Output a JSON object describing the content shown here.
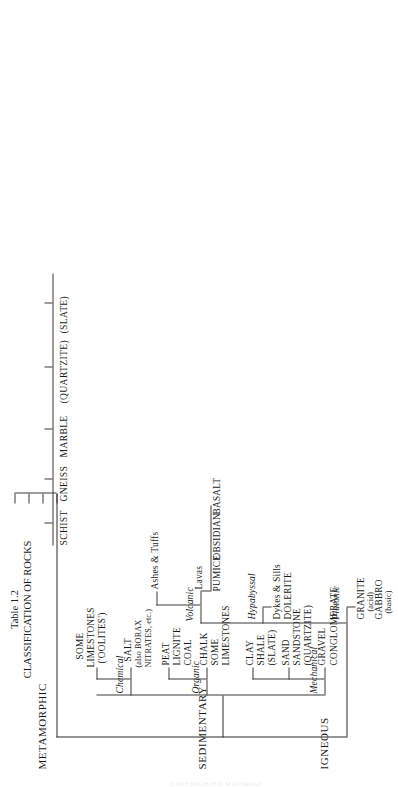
{
  "page": {
    "table_number": "Table 1.2",
    "title": "CLASSIFICATION OF ROCKS",
    "scan_header": "COPYRIGHTED MATERIAL"
  },
  "classes": [
    {
      "id": "igneous",
      "label": "IGNEOUS",
      "groups": [
        {
          "id": "plutonic",
          "label": "Plutonic",
          "entries": [
            {
              "name": "GRANITE",
              "note": "(acid)"
            },
            {
              "name": "GABBRO",
              "note": "(basic)"
            }
          ]
        },
        {
          "id": "hypabyssal",
          "label": "Hypabyssal",
          "entries": [
            {
              "name": "Dykes & Sills",
              "note": ""
            },
            {
              "name": "DOLERITE",
              "note": ""
            }
          ]
        },
        {
          "id": "volcanic",
          "label": "Volcanic",
          "subgroups": [
            {
              "id": "lavas",
              "label": "Lavas",
              "entries": [
                "PUMICE",
                "OBSIDIAN",
                "BASALT"
              ]
            },
            {
              "id": "ashes",
              "label": "Ashes & Tuffs",
              "entries": []
            }
          ]
        }
      ]
    },
    {
      "id": "sedimentary",
      "label": "SEDIMENTARY",
      "groups": [
        {
          "id": "mechanical",
          "label": "Mechanical",
          "rows": [
            {
              "source": "GRAVEL",
              "rock": "CONGLOMERATE",
              "meta": ""
            },
            {
              "source": "SAND",
              "rock": "SANDSTONE",
              "meta": "(QUARTZITE)"
            },
            {
              "source": "CLAY",
              "rock": "SHALE",
              "meta": "(SLATE)"
            }
          ]
        },
        {
          "id": "organic",
          "label": "Organic",
          "rows": [
            {
              "source": "CHALK",
              "rock": "SOME\nLIMESTONES",
              "meta": ""
            },
            {
              "source": "PEAT",
              "rock": "LIGNITE",
              "meta": "COAL"
            }
          ]
        },
        {
          "id": "chemical",
          "label": "Chemical",
          "rows": [
            {
              "source": "SALT",
              "rock": "(also BORAX\nNITRATES, etc.)",
              "meta": ""
            },
            {
              "source": "SOME\nLIMESTONES",
              "rock": "('OOLITES')",
              "meta": ""
            }
          ]
        }
      ]
    },
    {
      "id": "metamorphic",
      "label": "METAMORPHIC",
      "entries": [
        "SCHIST",
        "GNEISS",
        "MARBLE",
        "(QUARTZITE)",
        "(SLATE)"
      ]
    }
  ],
  "labels": {
    "igneous": "IGNEOUS",
    "sedimentary": "SEDIMENTARY",
    "metamorphic": "METAMORPHIC",
    "plutonic": "Plutonic",
    "hypabyssal": "Hypabyssal",
    "volcanic": "Volcanic",
    "mechanical": "Mechanical",
    "organic": "Organic",
    "chemical": "Chemical",
    "granite": "GRANITE",
    "granite_note": "(acid)",
    "gabbro": "GABBRO",
    "gabbro_note": "(basic)",
    "dykes_sills": "Dykes & Sills",
    "dolerite": "DOLERITE",
    "lavas": "Lavas",
    "ashes_tuffs": "Ashes & Tuffs",
    "pumice": "PUMICE",
    "obsidian": "OBSIDIAN",
    "basalt": "BASALT",
    "gravel": "GRAVEL",
    "conglomerate": "CONGLOMERATE",
    "sand": "SAND",
    "sandstone": "SANDSTONE",
    "quartzite_sed": "(QUARTZITE)",
    "clay": "CLAY",
    "shale": "SHALE",
    "slate_sed": "(SLATE)",
    "chalk": "CHALK",
    "some_limestones_org_1": "SOME",
    "some_limestones_org_2": "LIMESTONES",
    "peat": "PEAT",
    "lignite": "LIGNITE",
    "coal": "COAL",
    "salt": "SALT",
    "salt_note_1": "(also BORAX",
    "salt_note_2": "NITRATES, etc.)",
    "some_limestones_chem_1": "SOME",
    "some_limestones_chem_2": "LIMESTONES",
    "oolites": "('OOLITES')",
    "schist": "SCHIST",
    "gneiss": "GNEISS",
    "marble": "MARBLE",
    "quartzite_meta": "(QUARTZITE)",
    "slate_meta": "(SLATE)"
  }
}
